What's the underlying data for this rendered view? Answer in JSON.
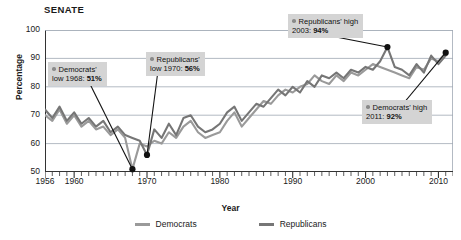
{
  "chart_data": {
    "type": "line",
    "title": "SENATE",
    "xlabel": "Year",
    "ylabel": "Percentage",
    "xlim": [
      1956,
      2012
    ],
    "ylim": [
      50,
      100
    ],
    "ytick_labels": [
      "50",
      "60",
      "70",
      "80",
      "90",
      "100"
    ],
    "ytick_values": [
      50,
      60,
      70,
      80,
      90,
      100
    ],
    "xtick_labels": [
      "1956",
      "1960",
      "1970",
      "1980",
      "1990",
      "2000",
      "2010"
    ],
    "xtick_values": [
      1956,
      1960,
      1970,
      1980,
      1990,
      2000,
      2010
    ],
    "minor_tick_interval": 1,
    "grid": "horizontal",
    "legend_position": "bottom-center",
    "series": [
      {
        "name": "Democrats",
        "color": "#9a9a9a",
        "x": [
          1956,
          1957,
          1958,
          1959,
          1960,
          1961,
          1962,
          1963,
          1964,
          1965,
          1966,
          1967,
          1968,
          1969,
          1970,
          1971,
          1972,
          1973,
          1974,
          1975,
          1976,
          1977,
          1978,
          1979,
          1980,
          1981,
          1982,
          1983,
          1984,
          1985,
          1986,
          1987,
          1988,
          1989,
          1990,
          1991,
          1992,
          1993,
          1994,
          1995,
          1996,
          1997,
          1998,
          1999,
          2000,
          2001,
          2002,
          2003,
          2004,
          2005,
          2006,
          2007,
          2008,
          2009,
          2010,
          2011
        ],
        "values": [
          70,
          68,
          72,
          67,
          70,
          66,
          68,
          65,
          66,
          63,
          65,
          62,
          51,
          60,
          59,
          61,
          60,
          64,
          62,
          66,
          68,
          64,
          62,
          63,
          64,
          68,
          71,
          66,
          69,
          72,
          75,
          74,
          77,
          79,
          78,
          80,
          81,
          84,
          82,
          81,
          84,
          82,
          85,
          84,
          86,
          88,
          87,
          86,
          85,
          84,
          83,
          87,
          86,
          90,
          89,
          92
        ]
      },
      {
        "name": "Republicans",
        "color": "#767676",
        "x": [
          1956,
          1957,
          1958,
          1959,
          1960,
          1961,
          1962,
          1963,
          1964,
          1965,
          1966,
          1967,
          1968,
          1969,
          1970,
          1971,
          1972,
          1973,
          1974,
          1975,
          1976,
          1977,
          1978,
          1979,
          1980,
          1981,
          1982,
          1983,
          1984,
          1985,
          1986,
          1987,
          1988,
          1989,
          1990,
          1991,
          1992,
          1993,
          1994,
          1995,
          1996,
          1997,
          1998,
          1999,
          2000,
          2001,
          2002,
          2003,
          2004,
          2005,
          2006,
          2007,
          2008,
          2009,
          2010,
          2011
        ],
        "values": [
          72,
          69,
          73,
          68,
          71,
          67,
          69,
          66,
          68,
          64,
          66,
          63,
          62,
          61,
          56,
          65,
          62,
          67,
          63,
          69,
          70,
          66,
          64,
          65,
          67,
          71,
          73,
          68,
          71,
          74,
          73,
          76,
          79,
          77,
          80,
          78,
          82,
          80,
          84,
          83,
          85,
          83,
          86,
          85,
          87,
          86,
          89,
          94,
          87,
          86,
          84,
          88,
          85,
          91,
          88,
          91
        ]
      }
    ],
    "annotations": [
      {
        "id": "dem-low",
        "series": "Democrats",
        "line1": "Democrats'",
        "line2_prefix": "low 1968: ",
        "line2_value": "51%",
        "point_year": 1968,
        "point_value": 51
      },
      {
        "id": "rep-low",
        "series": "Republicans",
        "line1": "Republicans'",
        "line2_prefix": "low 1970: ",
        "line2_value": "56%",
        "point_year": 1970,
        "point_value": 56
      },
      {
        "id": "rep-high",
        "series": "Republicans",
        "line1": "Republicans' high",
        "line2_prefix": "2003: ",
        "line2_value": "94%",
        "point_year": 2003,
        "point_value": 94
      },
      {
        "id": "dem-high",
        "series": "Democrats",
        "line1": "Democrats' high",
        "line2_prefix": "2011: ",
        "line2_value": "92%",
        "point_year": 2011,
        "point_value": 92
      }
    ]
  },
  "legend": {
    "items": [
      {
        "label": "Democrats",
        "color": "#9a9a9a"
      },
      {
        "label": "Republicans",
        "color": "#767676"
      }
    ]
  }
}
